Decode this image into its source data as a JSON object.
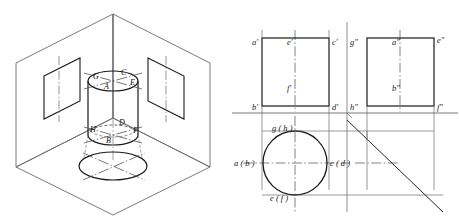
{
  "figure": {
    "stroke_dark": "#1a1a1a",
    "stroke_mid": "#555555",
    "stroke_light": "#8a8a8a",
    "background": "#ffffff"
  },
  "isometric": {
    "name": "isometric-projection-box",
    "description": "Three mutually perpendicular projection planes forming an open box with a cylinder standing inside",
    "solid": "cylinder",
    "point_labels": [
      {
        "id": "G",
        "text": "G",
        "x": 93,
        "y": 79
      },
      {
        "id": "C",
        "text": "C",
        "x": 121,
        "y": 75
      },
      {
        "id": "A",
        "text": "A",
        "x": 104,
        "y": 89
      },
      {
        "id": "E",
        "text": "E",
        "x": 130,
        "y": 85
      },
      {
        "id": "H",
        "text": "H",
        "x": 92,
        "y": 132
      },
      {
        "id": "D",
        "text": "D",
        "x": 120,
        "y": 125
      },
      {
        "id": "B",
        "text": "B",
        "x": 106,
        "y": 142
      },
      {
        "id": "F",
        "text": "F",
        "x": 131,
        "y": 133
      }
    ],
    "planes": [
      "left-vertical-plane",
      "right-vertical-plane",
      "horizontal-ground-plane"
    ],
    "plane_windows": [
      "left-plane-window",
      "right-plane-window"
    ],
    "ground_shadow": "bottom-ellipse-projection"
  },
  "views": {
    "front_view": {
      "name": "front-view-rectangle",
      "labels": [
        {
          "id": "a-prime",
          "text": "a′",
          "x": 257,
          "y": 44
        },
        {
          "id": "e-prime",
          "text": "e′",
          "x": 289,
          "y": 44
        },
        {
          "id": "c-prime",
          "text": "c′",
          "x": 331,
          "y": 44
        },
        {
          "id": "f-prime",
          "text": "f′",
          "x": 289,
          "y": 88
        },
        {
          "id": "b-prime",
          "text": "b′",
          "x": 257,
          "y": 105
        },
        {
          "id": "d-prime",
          "text": "d′",
          "x": 331,
          "y": 105
        }
      ]
    },
    "side_view": {
      "name": "side-view-rectangle",
      "labels": [
        {
          "id": "g-double",
          "text": "g″",
          "x": 349,
          "y": 44
        },
        {
          "id": "a-double",
          "text": "a″",
          "x": 383,
          "y": 44
        },
        {
          "id": "e-double",
          "text": "e″",
          "x": 432,
          "y": 42
        },
        {
          "id": "b-double",
          "text": "b″",
          "x": 383,
          "y": 88
        },
        {
          "id": "h-double",
          "text": "h″",
          "x": 349,
          "y": 105
        },
        {
          "id": "f-double",
          "text": "f″",
          "x": 432,
          "y": 105
        }
      ]
    },
    "top_view": {
      "name": "top-view-circle",
      "labels": [
        {
          "id": "gh",
          "text": "g ( h )",
          "x": 277,
          "y": 131
        },
        {
          "id": "ab",
          "text": "a ( b )",
          "x": 239,
          "y": 162
        },
        {
          "id": "cd",
          "text": "c ( d )",
          "x": 319,
          "y": 162
        },
        {
          "id": "ef",
          "text": "e ( f )",
          "x": 274,
          "y": 196
        }
      ]
    },
    "mitre_line": {
      "name": "forty-five-degree-mitre-line",
      "angle": "45°"
    },
    "ground_line": {
      "name": "ox-ground-line"
    }
  }
}
